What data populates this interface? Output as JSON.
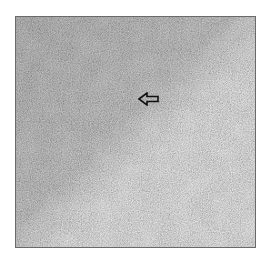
{
  "figure": {
    "type": "histology-micrograph",
    "colorspace": "grayscale",
    "background": "#ffffff",
    "border_color": "#6a6a6a",
    "tissue_base_color": "#8a8a8a",
    "annotation": {
      "kind": "arrow",
      "direction": "left",
      "color": "#111111"
    }
  }
}
